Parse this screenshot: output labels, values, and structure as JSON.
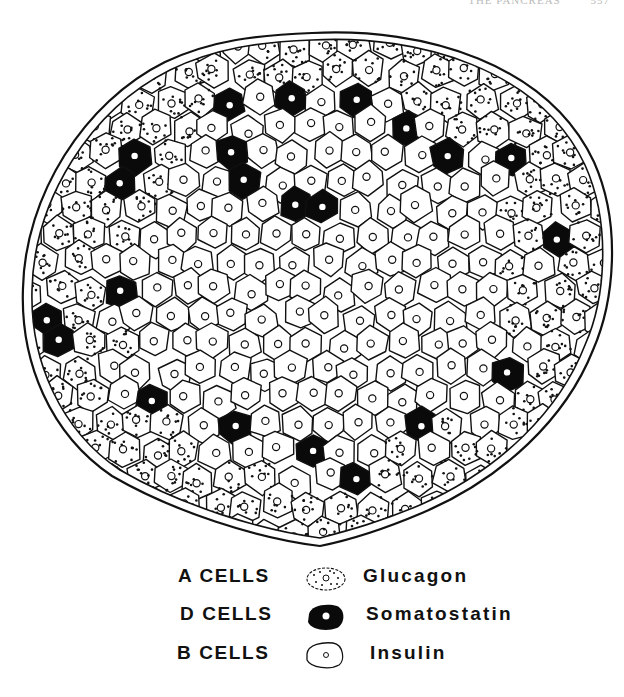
{
  "header": {
    "running_title": "THE PANCREAS",
    "page_number": "557"
  },
  "figure": {
    "colors": {
      "line": "#111111",
      "background": "#ffffff",
      "d_cell_fill": "#0a0a0a"
    }
  },
  "legend": {
    "rows": [
      {
        "cell_type": "A CELLS",
        "hormone": "Glucagon",
        "icon": "dotted-cell-icon"
      },
      {
        "cell_type": "D CELLS",
        "hormone": "Somatostatin",
        "icon": "black-cell-icon"
      },
      {
        "cell_type": "B CELLS",
        "hormone": "Insulin",
        "icon": "plain-cell-icon"
      }
    ]
  }
}
